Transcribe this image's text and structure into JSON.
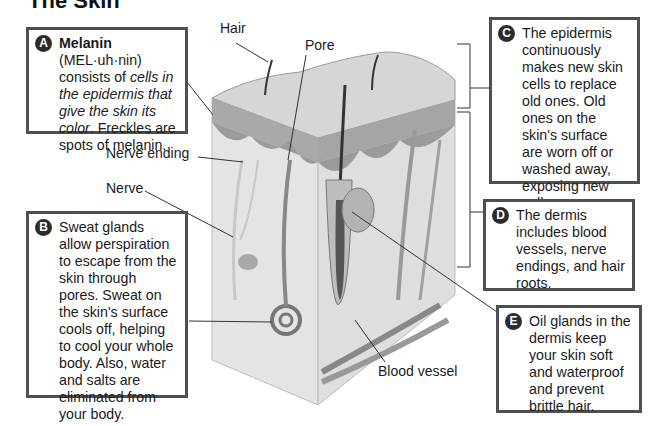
{
  "title": "The Skin",
  "boxes": {
    "a": {
      "letter": "A",
      "term": "Melanin",
      "pron": " (MEL·uh·nin) consists of ",
      "italic": "cells in the epidermis that give the skin its color",
      "rest": ". Freckles are spots of melanin."
    },
    "b": {
      "letter": "B",
      "text": "Sweat glands allow perspiration to escape from the skin through pores. Sweat on the skin's surface cools off, helping to cool your whole body. Also, water and salts are eliminated from your body."
    },
    "c": {
      "letter": "C",
      "text": "The epidermis continuously makes new skin cells to replace old ones. Old ones on the skin's surface are worn off or washed away, exposing new cells."
    },
    "d": {
      "letter": "D",
      "text": "The dermis includes blood vessels, nerve endings, and hair roots."
    },
    "e": {
      "letter": "E",
      "text": "Oil glands in the dermis keep your skin soft and waterproof and prevent brittle hair."
    }
  },
  "labels": {
    "hair": "Hair",
    "pore": "Pore",
    "nerve_ending": "Nerve ending",
    "nerve": "Nerve",
    "blood_vessel": "Blood vessel"
  },
  "colors": {
    "box_border": "#4f4f4f",
    "badge": "#2b2b2b"
  }
}
